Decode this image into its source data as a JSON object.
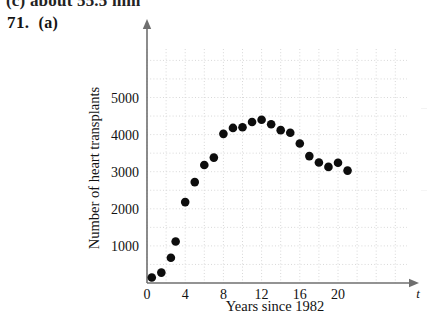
{
  "page": {
    "clipped_previous_line": "(c) about 55.5 mm",
    "exercise_number": "71.",
    "exercise_part": "(a)"
  },
  "chart_data": {
    "type": "scatter",
    "title": "",
    "xlabel": "Years since 1982",
    "ylabel": "Number of heart transplants",
    "x_axis_variable": "t",
    "xlim": [
      0,
      23
    ],
    "ylim": [
      0,
      5800
    ],
    "xticks": [
      0,
      4,
      8,
      12,
      16,
      20
    ],
    "xtick_labels": [
      "0",
      "4",
      "8",
      "12",
      "16",
      "20"
    ],
    "yticks": [
      1000,
      2000,
      3000,
      4000,
      5000
    ],
    "ytick_labels": [
      "1000",
      "2000",
      "3000",
      "4000",
      "5000"
    ],
    "grid": true,
    "grid_style": "dotted",
    "grid_x_step": 2,
    "grid_y_step": 500,
    "legend": "none",
    "marker": "filled-circle",
    "marker_color": "#0d0d0d",
    "axis_color": "#6f6f6f",
    "grid_color": "#d8d8d8",
    "x": [
      0.5,
      1.5,
      2.5,
      3.0,
      4.0,
      5.0,
      6.0,
      7.0,
      8.0,
      9.0,
      10.0,
      11.0,
      12.0,
      13.0,
      14.0,
      15.0,
      16.0,
      17.0,
      18.0,
      19.0,
      20.0,
      21.0
    ],
    "values": [
      150,
      280,
      680,
      1120,
      2180,
      2720,
      3180,
      3380,
      4020,
      4180,
      4200,
      4340,
      4400,
      4280,
      4120,
      4050,
      3760,
      3420,
      3250,
      3130,
      3240,
      3030
    ],
    "points": [
      {
        "x": 0.5,
        "y": 150
      },
      {
        "x": 1.5,
        "y": 280
      },
      {
        "x": 2.5,
        "y": 680
      },
      {
        "x": 3.0,
        "y": 1120
      },
      {
        "x": 4.0,
        "y": 2180
      },
      {
        "x": 5.0,
        "y": 2720
      },
      {
        "x": 6.0,
        "y": 3180
      },
      {
        "x": 7.0,
        "y": 3380
      },
      {
        "x": 8.0,
        "y": 4020
      },
      {
        "x": 9.0,
        "y": 4180
      },
      {
        "x": 10.0,
        "y": 4200
      },
      {
        "x": 11.0,
        "y": 4340
      },
      {
        "x": 12.0,
        "y": 4400
      },
      {
        "x": 13.0,
        "y": 4280
      },
      {
        "x": 14.0,
        "y": 4120
      },
      {
        "x": 15.0,
        "y": 4050
      },
      {
        "x": 16.0,
        "y": 3760
      },
      {
        "x": 17.0,
        "y": 3420
      },
      {
        "x": 18.0,
        "y": 3250
      },
      {
        "x": 19.0,
        "y": 3130
      },
      {
        "x": 20.0,
        "y": 3240
      },
      {
        "x": 21.0,
        "y": 3030
      }
    ]
  }
}
